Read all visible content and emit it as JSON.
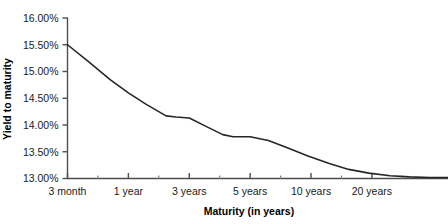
{
  "chart_data": {
    "type": "line",
    "title": "",
    "subtitle": "",
    "xlabel": "Maturity (in years)",
    "ylabel": "Yield to maturity",
    "grid": false,
    "legend": false,
    "legend_position": "none",
    "line_color": "#262626",
    "axis_color": "#4d4d4d",
    "background_color": "#ffffff",
    "ylim": [
      13.0,
      16.0
    ],
    "ytick_values": [
      13.0,
      13.5,
      14.0,
      14.5,
      15.0,
      15.5,
      16.0
    ],
    "ytick_labels": [
      "13.00%",
      "13.50%",
      "14.00%",
      "14.50%",
      "15.00%",
      "15.50%",
      "16.00%"
    ],
    "xtick_labels": [
      "3 month",
      "1 year",
      "3 years",
      "5 years",
      "10 years",
      "20 years"
    ],
    "xtick_positions": [
      0,
      1,
      2,
      3,
      4,
      5
    ],
    "minor_xtick_positions": [
      0.5,
      1.5,
      2.5,
      3.5,
      4.5,
      5.5
    ],
    "x_axis_max": 6.25,
    "x": [
      0,
      0.35,
      0.7,
      1.0,
      1.3,
      1.62,
      1.78,
      2.0,
      2.3,
      2.55,
      2.72,
      3.0,
      3.3,
      3.62,
      3.95,
      4.3,
      4.62,
      4.95,
      5.3,
      5.62,
      5.95,
      6.25
    ],
    "values": [
      15.5,
      15.18,
      14.85,
      14.6,
      14.38,
      14.17,
      14.15,
      14.13,
      13.96,
      13.82,
      13.78,
      13.78,
      13.71,
      13.57,
      13.42,
      13.28,
      13.17,
      13.1,
      13.05,
      13.03,
      13.02,
      13.02
    ],
    "series": [
      {
        "name": "Yield curve",
        "values": [
          15.5,
          15.18,
          14.85,
          14.6,
          14.38,
          14.17,
          14.15,
          14.13,
          13.96,
          13.82,
          13.78,
          13.78,
          13.71,
          13.57,
          13.42,
          13.28,
          13.17,
          13.1,
          13.05,
          13.03,
          13.02,
          13.02
        ]
      }
    ],
    "annotations": []
  }
}
